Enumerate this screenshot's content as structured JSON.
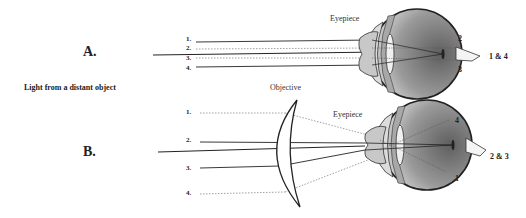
{
  "panels": {
    "a": {
      "letter": "A.",
      "eyepiece_label": "Eyepiece",
      "ray_labels": [
        "1.",
        "2.",
        "3.",
        "4."
      ],
      "retina_labels": {
        "top": "2",
        "bottom": "3",
        "nerve": "1 & 4"
      }
    },
    "b": {
      "letter": "B.",
      "objective_label": "Objective",
      "eyepiece_label": "Eyepiece",
      "ray_labels": [
        "1.",
        "2.",
        "3.",
        "4."
      ],
      "retina_labels": {
        "top": "4",
        "bottom": "1",
        "nerve": "2 & 3"
      }
    }
  },
  "caption": "Light from a distant object",
  "colors": {
    "line": "#222222",
    "dotted": "#777777",
    "eye_dark": "#6e6e6e",
    "eye_light": "#d9d9d9",
    "lens": "#c8c8c8"
  }
}
